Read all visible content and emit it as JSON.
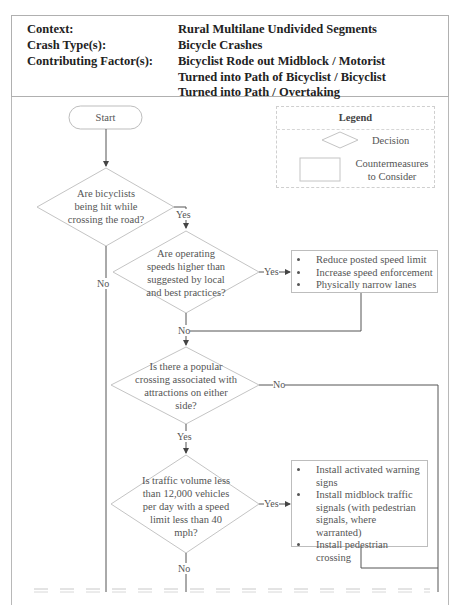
{
  "header": {
    "rows": [
      {
        "label": "Context:",
        "value": "Rural Multilane Undivided Segments"
      },
      {
        "label": "Crash Type(s):",
        "value": "Bicycle Crashes"
      },
      {
        "label": "Contributing Factor(s):",
        "value_lines": [
          "Bicyclist Rode out Midblock / Motorist",
          "Turned into Path of Bicyclist / Bicyclist",
          "Turned into Path / Overtaking"
        ]
      }
    ]
  },
  "legend": {
    "title": "Legend",
    "items": [
      {
        "shape": "diamond-icon",
        "label": "Decision"
      },
      {
        "shape": "rectangle-icon",
        "label_lines": [
          "Countermeasures",
          "to Consider"
        ]
      }
    ]
  },
  "flowchart": {
    "start": "Start",
    "decisions": [
      {
        "id": "d1",
        "lines": [
          "Are bicyclists",
          "being hit while",
          "crossing the road?"
        ],
        "yes": "Yes",
        "no": "No"
      },
      {
        "id": "d2",
        "lines": [
          "Are operating",
          "speeds higher than",
          "suggested by local",
          "and best practices?"
        ],
        "yes": "Yes",
        "no": "No"
      },
      {
        "id": "d3",
        "lines": [
          "Is there a popular",
          "crossing associated with",
          "attractions on either",
          "side?"
        ],
        "yes": "Yes",
        "no": "No"
      },
      {
        "id": "d4",
        "lines": [
          "Is traffic volume less",
          "than 12,000 vehicles",
          "per day with a speed",
          "limit less than 40",
          "mph?"
        ],
        "yes": "Yes",
        "no": "No"
      }
    ],
    "countermeasures": [
      {
        "id": "c1",
        "items": [
          "Reduce posted speed limit",
          "Increase speed enforcement",
          "Physically narrow lanes"
        ]
      },
      {
        "id": "c2",
        "items": [
          "Install activated warning signs",
          "Install midblock traffic signals (with pedestrian signals, where warranted)",
          "Install pedestrian crossing"
        ]
      }
    ]
  },
  "colors": {
    "line": "#555555",
    "shape_border": "#bdbdbd",
    "text": "#555555",
    "header_text": "#222222"
  }
}
